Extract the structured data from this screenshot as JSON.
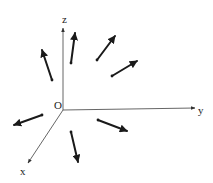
{
  "diagram": {
    "title": "",
    "colors": {
      "background": "#ffffff",
      "axis": "#555555",
      "vector": "#1a1a1a",
      "label": "#222222"
    },
    "origin": {
      "label": "O",
      "x": 63,
      "y": 110
    },
    "axes": [
      {
        "name": "z",
        "label": "z",
        "from": [
          63,
          110
        ],
        "to": [
          63,
          28
        ],
        "label_pos": [
          62,
          23
        ]
      },
      {
        "name": "y",
        "label": "y",
        "from": [
          63,
          110
        ],
        "to": [
          195,
          108
        ],
        "label_pos": [
          198,
          114
        ]
      },
      {
        "name": "x",
        "label": "x",
        "from": [
          63,
          110
        ],
        "to": [
          28,
          163
        ],
        "label_pos": [
          20,
          175
        ]
      }
    ],
    "vectors": [
      {
        "id": "v1",
        "tail": [
          52,
          80
        ],
        "head": [
          42,
          50
        ]
      },
      {
        "id": "v2",
        "tail": [
          71,
          63
        ],
        "head": [
          75,
          33
        ]
      },
      {
        "id": "v3",
        "tail": [
          97,
          60
        ],
        "head": [
          115,
          36
        ]
      },
      {
        "id": "v4",
        "tail": [
          112,
          76
        ],
        "head": [
          137,
          61
        ]
      },
      {
        "id": "v5",
        "tail": [
          42,
          115
        ],
        "head": [
          14,
          125
        ]
      },
      {
        "id": "v6",
        "tail": [
          98,
          120
        ],
        "head": [
          127,
          131
        ]
      },
      {
        "id": "v7",
        "tail": [
          71,
          132
        ],
        "head": [
          78,
          162
        ]
      }
    ]
  }
}
